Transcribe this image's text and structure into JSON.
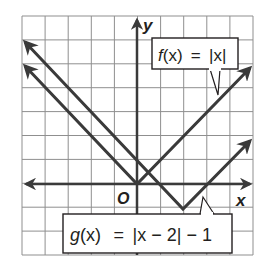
{
  "figure": {
    "type": "coordinate-plane-graph",
    "grid": {
      "x_range": [
        -5,
        5
      ],
      "y_range": [
        -3,
        7
      ],
      "step": 1
    },
    "axes": {
      "x_label": "x",
      "y_label": "y",
      "origin_label": "O"
    },
    "colors": {
      "grid": "#8f8f8f",
      "line": "#3a3a3a",
      "text": "#231f20",
      "box_border": "#231f20",
      "background": "#ffffff"
    },
    "functions": [
      {
        "id": "f",
        "label": {
          "name": "f",
          "arg": "(x)",
          "eq": "=",
          "expr": "|x|"
        },
        "vertex": [
          0,
          0
        ],
        "left_end": [
          -4.9,
          4.9
        ],
        "right_end": [
          5,
          5
        ]
      },
      {
        "id": "g",
        "label": {
          "name": "g",
          "arg": "(x)",
          "eq": "=",
          "expr": "|x − 2| − 1"
        },
        "vertex": [
          2,
          -1
        ],
        "left_end": [
          -4.9,
          5.9
        ],
        "right_end": [
          5,
          2
        ]
      }
    ]
  }
}
